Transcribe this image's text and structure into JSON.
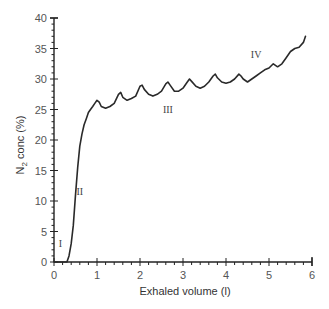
{
  "chart_data": {
    "type": "line",
    "title": "",
    "xlabel": "Exhaled volume (l)",
    "ylabel": "N2 conc (%)",
    "ylabel_parts": {
      "main": "N",
      "sub": "2",
      "rest": " conc (%)"
    },
    "xlim": [
      0,
      6
    ],
    "ylim": [
      0,
      40
    ],
    "grid": false,
    "legend": null,
    "x_ticks": [
      0,
      1,
      2,
      3,
      4,
      5,
      6
    ],
    "y_ticks": [
      0,
      5,
      10,
      15,
      20,
      25,
      30,
      35,
      40
    ],
    "x_tick_labels": [
      "0",
      "1",
      "2",
      "3",
      "4",
      "5",
      "6"
    ],
    "y_tick_labels": [
      "0",
      "5",
      "10",
      "15",
      "20",
      "25",
      "30",
      "35",
      "40"
    ],
    "annotations": [
      {
        "text": "I",
        "x": 0.15,
        "y": 2.5
      },
      {
        "text": "II",
        "x": 0.6,
        "y": 11
      },
      {
        "text": "III",
        "x": 2.65,
        "y": 24.5
      },
      {
        "text": "IV",
        "x": 4.7,
        "y": 33.5
      }
    ],
    "series": [
      {
        "name": "N2 washout",
        "x": [
          0.0,
          0.1,
          0.2,
          0.3,
          0.35,
          0.4,
          0.45,
          0.5,
          0.55,
          0.6,
          0.65,
          0.7,
          0.75,
          0.8,
          0.85,
          0.9,
          0.95,
          1.0,
          1.05,
          1.1,
          1.2,
          1.3,
          1.4,
          1.5,
          1.55,
          1.6,
          1.7,
          1.8,
          1.9,
          2.0,
          2.05,
          2.1,
          2.2,
          2.3,
          2.4,
          2.5,
          2.6,
          2.65,
          2.7,
          2.8,
          2.9,
          3.0,
          3.1,
          3.15,
          3.2,
          3.3,
          3.4,
          3.5,
          3.6,
          3.7,
          3.75,
          3.8,
          3.9,
          4.0,
          4.1,
          4.2,
          4.3,
          4.35,
          4.4,
          4.5,
          4.6,
          4.7,
          4.8,
          4.9,
          5.0,
          5.1,
          5.2,
          5.3,
          5.4,
          5.5,
          5.6,
          5.7,
          5.8,
          5.85
        ],
        "values": [
          0,
          0,
          0,
          0,
          1,
          3,
          6,
          11,
          15.5,
          19,
          21,
          22.5,
          23.5,
          24.5,
          25,
          25.5,
          26,
          26.5,
          26.2,
          25.5,
          25.2,
          25.5,
          26,
          27.5,
          27.8,
          27,
          26.5,
          26.8,
          27.2,
          28.8,
          29,
          28.3,
          27.5,
          27.2,
          27.5,
          28,
          29.2,
          29.5,
          29,
          28,
          28,
          28.5,
          29.5,
          30,
          29.6,
          28.8,
          28.5,
          28.8,
          29.5,
          30.5,
          30.8,
          30.2,
          29.5,
          29.3,
          29.5,
          30,
          30.8,
          30.5,
          30,
          29.5,
          30,
          30.5,
          31,
          31.5,
          31.8,
          32.5,
          32,
          32.5,
          33.5,
          34.5,
          35,
          35.2,
          36,
          37
        ]
      }
    ]
  }
}
